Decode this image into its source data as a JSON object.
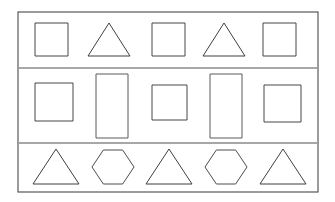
{
  "figure": {
    "title": "Geometric shapes arranged in a bordered grid of three rows",
    "background_color": "#ffffff",
    "frame": {
      "stroke_color": "#4a4a4a",
      "x": 18,
      "y": 12,
      "width": 300,
      "height": 180
    },
    "dividers": [
      {
        "name": "row-divider-1",
        "y": 68,
        "x1": 19,
        "x2": 317,
        "color": "#8a8a8a"
      },
      {
        "name": "row-divider-2",
        "y": 143,
        "x1": 19,
        "x2": 317,
        "color": "#8a8a8a"
      }
    ],
    "rows": [
      {
        "row_label": "row-1",
        "pattern": "square, triangle, square, triangle, square",
        "shapes": [
          {
            "name": "square",
            "type": "square",
            "x": 35,
            "y": 23,
            "width": 33,
            "height": 33,
            "color": "#474747"
          },
          {
            "name": "triangle",
            "type": "triangle",
            "x": 88,
            "y": 23,
            "width": 42,
            "height": 33,
            "color": "#3f3f3f"
          },
          {
            "name": "square",
            "type": "square",
            "x": 152,
            "y": 23,
            "width": 33,
            "height": 33,
            "color": "#474747"
          },
          {
            "name": "triangle",
            "type": "triangle",
            "x": 203,
            "y": 23,
            "width": 42,
            "height": 33,
            "color": "#3f3f3f"
          },
          {
            "name": "square",
            "type": "square",
            "x": 263,
            "y": 23,
            "width": 33,
            "height": 33,
            "color": "#474747"
          }
        ]
      },
      {
        "row_label": "row-2",
        "pattern": "square, tall rectangle, square, tall rectangle, square",
        "shapes": [
          {
            "name": "square",
            "type": "square",
            "x": 35,
            "y": 83,
            "width": 38,
            "height": 38,
            "color": "#474747"
          },
          {
            "name": "tall-rectangle",
            "type": "rectangle",
            "x": 96,
            "y": 74,
            "width": 32,
            "height": 64,
            "color": "#5a5a5a"
          },
          {
            "name": "square",
            "type": "square",
            "x": 152,
            "y": 85,
            "width": 35,
            "height": 35,
            "color": "#474747"
          },
          {
            "name": "tall-rectangle",
            "type": "rectangle",
            "x": 210,
            "y": 74,
            "width": 32,
            "height": 64,
            "color": "#5a5a5a"
          },
          {
            "name": "square",
            "type": "square",
            "x": 264,
            "y": 85,
            "width": 37,
            "height": 37,
            "color": "#474747"
          }
        ]
      },
      {
        "row_label": "row-3",
        "pattern": "triangle, hexagon, triangle, hexagon, triangle",
        "shapes": [
          {
            "name": "triangle",
            "type": "triangle",
            "x": 33,
            "y": 149,
            "width": 46,
            "height": 35,
            "color": "#3f3f3f"
          },
          {
            "name": "hexagon",
            "type": "hexagon",
            "x": 92,
            "y": 150,
            "width": 42,
            "height": 34,
            "color": "#4c4c4c"
          },
          {
            "name": "triangle",
            "type": "triangle",
            "x": 146,
            "y": 149,
            "width": 46,
            "height": 35,
            "color": "#3f3f3f"
          },
          {
            "name": "hexagon",
            "type": "hexagon",
            "x": 205,
            "y": 150,
            "width": 42,
            "height": 34,
            "color": "#4c4c4c"
          },
          {
            "name": "triangle",
            "type": "triangle",
            "x": 260,
            "y": 149,
            "width": 46,
            "height": 35,
            "color": "#3f3f3f"
          }
        ]
      }
    ]
  }
}
